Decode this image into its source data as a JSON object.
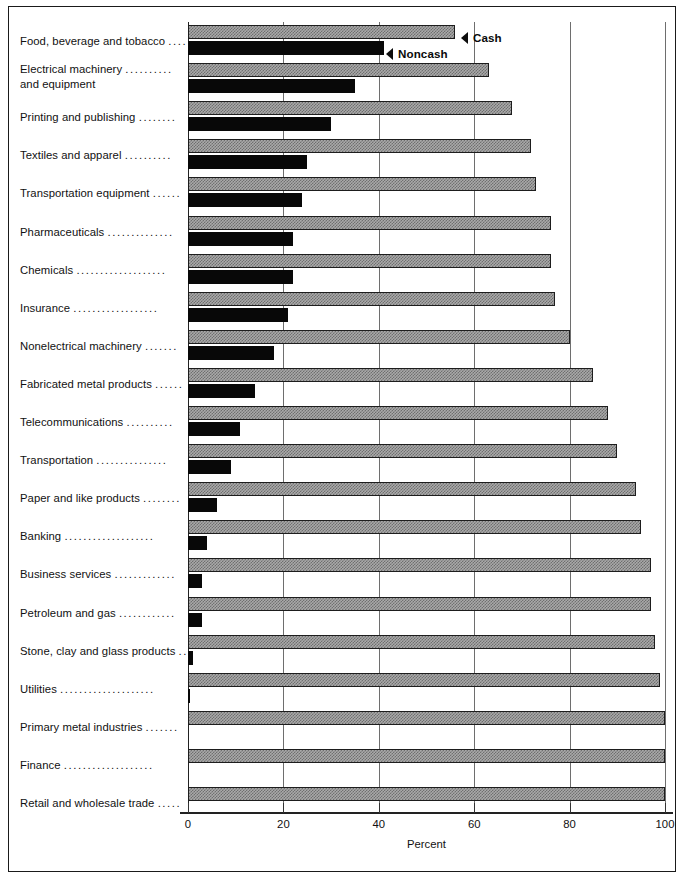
{
  "chart_data": {
    "type": "bar",
    "orientation": "horizontal",
    "title": "",
    "xlabel": "Percent",
    "ylabel": "",
    "xlim": [
      0,
      100
    ],
    "xticks": [
      0,
      20,
      40,
      60,
      80,
      100
    ],
    "xtick_labels": [
      "0",
      "20",
      "40",
      "60",
      "80",
      "100"
    ],
    "grid": true,
    "grid_axis": "x",
    "legend_position": "inside-top-right",
    "categories": [
      "Food, beverage and tobacco",
      "Electrical machinery and equipment",
      "Printing and publishing",
      "Textiles and apparel",
      "Transportation equipment",
      "Pharmaceuticals",
      "Chemicals",
      "Insurance",
      "Nonelectrical machinery",
      "Fabricated metal products",
      "Telecommunications",
      "Transportation",
      "Paper and like products",
      "Banking",
      "Business services",
      "Petroleum and gas",
      "Stone, clay and glass products",
      "Utilities",
      "Primary metal industries",
      "Finance",
      "Retail and wholesale trade"
    ],
    "series": [
      {
        "name": "Cash",
        "color": "#a9a9a9",
        "values": [
          56,
          63,
          68,
          72,
          73,
          76,
          76,
          77,
          80,
          85,
          88,
          90,
          94,
          95,
          97,
          97,
          98,
          99,
          100,
          100,
          100
        ]
      },
      {
        "name": "Noncash",
        "color": "#080808",
        "values": [
          41,
          35,
          30,
          25,
          24,
          22,
          22,
          21,
          18,
          14,
          11,
          9,
          6,
          4,
          3,
          3,
          1,
          0.5,
          0,
          0,
          0
        ]
      }
    ]
  },
  "labels": {
    "rows": [
      {
        "text": "Food, beverage and tobacco",
        "leader": "....",
        "two_line": false,
        "line2": ""
      },
      {
        "text": "Electrical machinery",
        "leader": "..........",
        "two_line": true,
        "line2": "and equipment"
      },
      {
        "text": "Printing and publishing",
        "leader": "........",
        "two_line": false,
        "line2": ""
      },
      {
        "text": "Textiles and apparel",
        "leader": "..........",
        "two_line": false,
        "line2": ""
      },
      {
        "text": "Transportation equipment",
        "leader": "......",
        "two_line": false,
        "line2": ""
      },
      {
        "text": "Pharmaceuticals",
        "leader": "..............",
        "two_line": false,
        "line2": ""
      },
      {
        "text": "Chemicals",
        "leader": "...................",
        "two_line": false,
        "line2": ""
      },
      {
        "text": "Insurance",
        "leader": "..................",
        "two_line": false,
        "line2": ""
      },
      {
        "text": "Nonelectrical machinery",
        "leader": ".......",
        "two_line": false,
        "line2": ""
      },
      {
        "text": "Fabricated metal products",
        "leader": "......",
        "two_line": false,
        "line2": ""
      },
      {
        "text": "Telecommunications",
        "leader": "..........",
        "two_line": false,
        "line2": ""
      },
      {
        "text": "Transportation",
        "leader": "...............",
        "two_line": false,
        "line2": ""
      },
      {
        "text": "Paper and like products",
        "leader": "........",
        "two_line": false,
        "line2": ""
      },
      {
        "text": "Banking",
        "leader": "...................",
        "two_line": false,
        "line2": ""
      },
      {
        "text": "Business services",
        "leader": ".............",
        "two_line": false,
        "line2": ""
      },
      {
        "text": "Petroleum and gas",
        "leader": "............",
        "two_line": false,
        "line2": ""
      },
      {
        "text": "Stone, clay and glass products",
        "leader": "..",
        "two_line": false,
        "line2": ""
      },
      {
        "text": "Utilities",
        "leader": "....................",
        "two_line": false,
        "line2": ""
      },
      {
        "text": "Primary metal industries",
        "leader": ".......",
        "two_line": false,
        "line2": ""
      },
      {
        "text": "Finance",
        "leader": "...................",
        "two_line": false,
        "line2": ""
      },
      {
        "text": "Retail and wholesale trade",
        "leader": ".....",
        "two_line": false,
        "line2": ""
      }
    ]
  },
  "legend": {
    "cash_label": "Cash",
    "noncash_label": "Noncash"
  },
  "axis": {
    "title": "Percent",
    "ticks": [
      "0",
      "20",
      "40",
      "60",
      "80",
      "100"
    ]
  },
  "colors": {
    "cash_fill": "#a9a9a9",
    "noncash_fill": "#080808",
    "frame": "#1a1a1a",
    "gridline": "#6e6e6e"
  }
}
